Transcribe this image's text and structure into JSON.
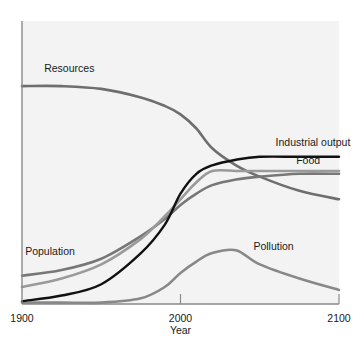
{
  "chart_data": {
    "type": "line",
    "title": "",
    "xlabel": "Year",
    "ylabel": "",
    "xlim": [
      1900,
      2100
    ],
    "ylim": [
      0,
      100
    ],
    "x_ticks": [
      1900,
      2000,
      2100
    ],
    "grid": false,
    "legend": "inline labels",
    "x": [
      1900,
      1925,
      1950,
      1975,
      1990,
      2000,
      2010,
      2020,
      2035,
      2050,
      2075,
      2100
    ],
    "series": [
      {
        "name": "Resources",
        "color": "#6e6e6e",
        "values": [
          77,
          77,
          76,
          73,
          70,
          67,
          62,
          55,
          49,
          45,
          40,
          37
        ],
        "label_pos": [
          1914,
          82
        ]
      },
      {
        "name": "Industrial output",
        "color": "#111111",
        "values": [
          1,
          3,
          7,
          18,
          28,
          39,
          46,
          49,
          51,
          52,
          52,
          52
        ],
        "label_pos": [
          2060,
          56
        ]
      },
      {
        "name": "Food",
        "color": "#9a9a9a",
        "values": [
          6,
          9,
          14,
          23,
          31,
          37,
          43,
          47,
          47,
          47,
          47,
          47
        ],
        "label_pos": [
          2073,
          49.5
        ]
      },
      {
        "name": "Population",
        "color": "#777777",
        "values": [
          10,
          12,
          16,
          24,
          30,
          35,
          39,
          42,
          44,
          45,
          46,
          46
        ],
        "label_pos": [
          1902,
          17.5
        ]
      },
      {
        "name": "Pollution",
        "color": "#888888",
        "values": [
          0.5,
          0.5,
          0.5,
          2,
          6,
          11,
          15,
          18,
          19,
          14,
          9,
          5
        ],
        "label_pos": [
          2046,
          19
        ]
      }
    ]
  },
  "axes": {
    "x_tick_labels": [
      "1900",
      "2000",
      "2100"
    ],
    "x_title": "Year"
  }
}
